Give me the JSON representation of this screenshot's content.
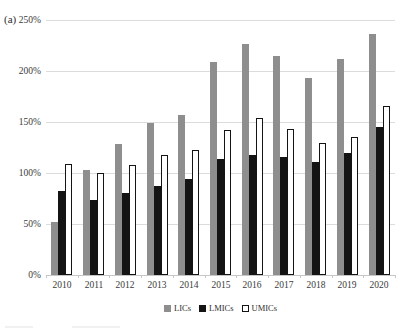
{
  "panel_label": "(a)",
  "chart_data": {
    "type": "bar",
    "title": "",
    "xlabel": "",
    "ylabel": "",
    "categories": [
      "2010",
      "2011",
      "2012",
      "2013",
      "2014",
      "2015",
      "2016",
      "2017",
      "2018",
      "2019",
      "2020"
    ],
    "series": [
      {
        "name": "LICs",
        "color": "#8e8e8e",
        "outlined": false,
        "values": [
          52,
          103,
          128,
          149,
          157,
          209,
          226,
          215,
          193,
          212,
          236
        ]
      },
      {
        "name": "LMICs",
        "color": "#141414",
        "outlined": false,
        "values": [
          82,
          74,
          80,
          87,
          94,
          114,
          118,
          116,
          111,
          120,
          145
        ]
      },
      {
        "name": "UMICs",
        "color": "#ffffff",
        "outlined": true,
        "values": [
          109,
          100,
          108,
          118,
          123,
          142,
          154,
          143,
          129,
          135,
          166
        ]
      }
    ],
    "ylim": [
      0,
      250
    ],
    "ytick_step": 50,
    "ytick_labels": [
      "0%",
      "50%",
      "100%",
      "150%",
      "200%",
      "250%"
    ],
    "grid": true,
    "legend_position": "bottom"
  },
  "colors": {
    "gridline": "#dcdcdc",
    "axis": "#c7c7c7",
    "text": "#3a3a3a",
    "bar_gray": "#8e8e8e",
    "bar_black": "#141414",
    "bar_white": "#ffffff"
  }
}
